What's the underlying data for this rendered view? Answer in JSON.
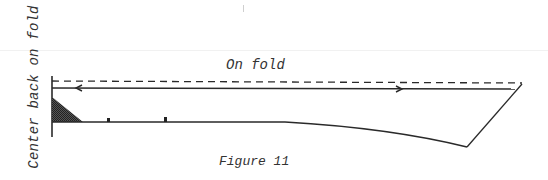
{
  "figure": {
    "caption": "Figure 11",
    "labels": {
      "side": "Center back on fold",
      "fold": "On fold"
    },
    "colors": {
      "line": "#2a2a2a",
      "text": "#333333",
      "hatch": "#3a3a3a",
      "background": "#ffffff"
    },
    "elements": {
      "center_back_edge": "vertical fold edge",
      "fold_line": "dashed fold line",
      "grainline": "double-headed grainline arrow",
      "hem_curve": "lower pattern edge",
      "side_seam": "right slanted edge",
      "shaded_corner": "hatched triangle",
      "markers": [
        "notch-dot-1",
        "notch-dot-2"
      ]
    }
  }
}
